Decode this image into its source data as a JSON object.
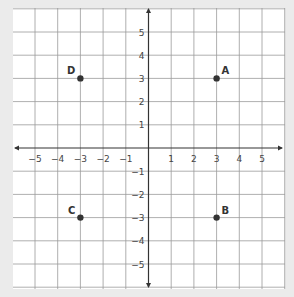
{
  "chart_data": {
    "type": "scatter",
    "title": "",
    "xlabel": "",
    "ylabel": "",
    "xlim": [
      -5.9,
      6
    ],
    "ylim": [
      -6.1,
      5.9
    ],
    "grid": true,
    "x_ticks": [
      -5,
      -4,
      -3,
      -2,
      -1,
      1,
      2,
      3,
      4,
      5
    ],
    "y_ticks": [
      5,
      4,
      3,
      2,
      1,
      -1,
      -2,
      -3,
      -4,
      -5
    ],
    "points": [
      {
        "label": "A",
        "x": 3,
        "y": 3,
        "label_pos": "upper-right"
      },
      {
        "label": "B",
        "x": 3,
        "y": -3,
        "label_pos": "upper-right"
      },
      {
        "label": "C",
        "x": -3,
        "y": -3,
        "label_pos": "upper-left"
      },
      {
        "label": "D",
        "x": -3,
        "y": 3,
        "label_pos": "upper-left"
      }
    ],
    "legend": null
  },
  "style": {
    "page_background": "#ebebeb",
    "plot_background": "#ffffff",
    "grid_color": "#9a9a9a",
    "axis_color": "#333333",
    "point_color": "#333333"
  }
}
